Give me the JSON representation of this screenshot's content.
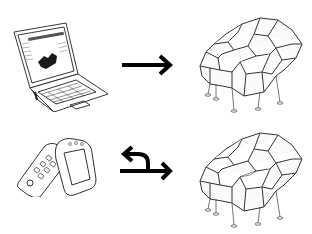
{
  "diagram": {
    "background": "#ffffff",
    "stroke_color": "#222222",
    "arrow_color": "#000000",
    "rows": [
      {
        "source": {
          "icon": "laptop-icon",
          "label": ""
        },
        "connector": {
          "icon": "arrow-right-icon",
          "direction": "one-way"
        },
        "target": {
          "icon": "voronoi-pavilion-icon",
          "label": ""
        }
      },
      {
        "source": {
          "icon": "mobile-phones-icon",
          "label": ""
        },
        "connector": {
          "icon": "arrow-bidirectional-icon",
          "direction": "two-way"
        },
        "target": {
          "icon": "voronoi-pavilion-icon",
          "label": ""
        }
      }
    ]
  }
}
